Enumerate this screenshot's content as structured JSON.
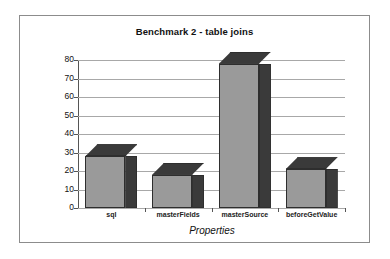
{
  "chart_data": {
    "type": "bar",
    "title": "Benchmark 2 - table joins",
    "xlabel": "Properties",
    "ylabel": "Seconds",
    "categories": [
      "sql",
      "masterFields",
      "masterSource",
      "beforeGetValue"
    ],
    "values": [
      28,
      18,
      78,
      21
    ],
    "ylim": [
      0,
      80
    ],
    "yticks": [
      0,
      10,
      20,
      30,
      40,
      50,
      60,
      70,
      80
    ],
    "ytick_labels": [
      "0",
      "10",
      "20",
      "30",
      "40",
      "50",
      "60",
      "70",
      "80"
    ],
    "grid": true,
    "legend": false,
    "style": "3d-column",
    "colors": {
      "bar_front": "#9a9a9a",
      "bar_side": "#3a3a3a",
      "bar_outline": "#2e2e2e",
      "gridline": "#a8a8a8",
      "axis": "#555555",
      "frame": "#8c8c8c",
      "background": "#ffffff",
      "text": "#111111"
    }
  }
}
